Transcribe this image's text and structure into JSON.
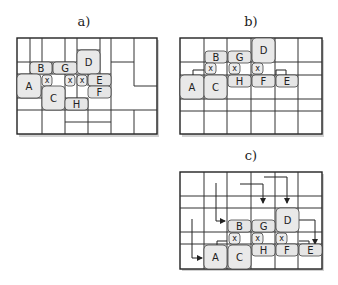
{
  "figure": {
    "panels": [
      {
        "id": "a",
        "label": "a)",
        "description": "Irregular cell partition with labeled cells",
        "cells": {
          "A": "A",
          "B": "B",
          "C": "C",
          "D": "D",
          "E": "E",
          "F": "F",
          "G": "G",
          "H": "H",
          "x": "x"
        }
      },
      {
        "id": "b",
        "label": "b)",
        "description": "Regular 6-column grid with cells placed",
        "cells": {
          "A": "A",
          "B": "B",
          "C": "C",
          "D": "D",
          "E": "E",
          "F": "F",
          "G": "G",
          "H": "H",
          "x": "x"
        }
      },
      {
        "id": "c",
        "label": "c)",
        "description": "Regular grid with routing arrows into cells",
        "cells": {
          "A": "A",
          "B": "B",
          "C": "C",
          "D": "D",
          "E": "E",
          "F": "F",
          "G": "G",
          "H": "H",
          "x": "x"
        }
      }
    ]
  },
  "panel_a": {
    "label": "a)",
    "A": "A",
    "B": "B",
    "C": "C",
    "D": "D",
    "E": "E",
    "F": "F",
    "G": "G",
    "H": "H",
    "x": "x"
  },
  "panel_b": {
    "label": "b)",
    "A": "A",
    "B": "B",
    "C": "C",
    "D": "D",
    "E": "E",
    "F": "F",
    "G": "G",
    "H": "H",
    "x": "x"
  },
  "panel_c": {
    "label": "c)",
    "A": "A",
    "B": "B",
    "C": "C",
    "D": "D",
    "E": "E",
    "F": "F",
    "G": "G",
    "H": "H",
    "x": "x"
  }
}
